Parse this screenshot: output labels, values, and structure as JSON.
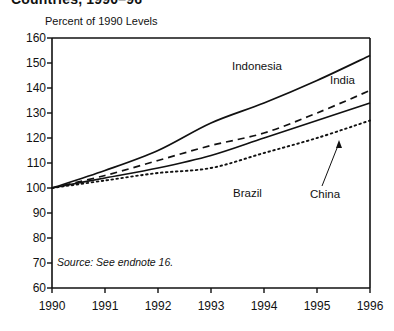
{
  "title": "Countries, 1990–96",
  "axis_note": "Percent of 1990 Levels",
  "source_note": "Source: See endnote 16.",
  "labels": {
    "indonesia": "Indonesia",
    "india": "India",
    "brazil": "Brazil",
    "china": "China"
  },
  "chart_data": {
    "type": "line",
    "title": "Countries, 1990–96",
    "xlabel": "",
    "ylabel": "Percent of 1990 Levels",
    "x": [
      1990,
      1991,
      1992,
      1993,
      1994,
      1995,
      1996
    ],
    "xtick_labels": [
      "1990",
      "1991",
      "1992",
      "1993",
      "1994",
      "1995",
      "1996"
    ],
    "ytick_labels": [
      "60",
      "70",
      "80",
      "90",
      "100",
      "110",
      "120",
      "130",
      "140",
      "150",
      "160"
    ],
    "yticks": [
      60,
      70,
      80,
      90,
      100,
      110,
      120,
      130,
      140,
      150,
      160
    ],
    "xlim": [
      1990,
      1996
    ],
    "ylim": [
      60,
      160
    ],
    "grid": false,
    "legend_position": "inline-annotations",
    "series": [
      {
        "name": "Indonesia",
        "style": "solid",
        "values": [
          100,
          107,
          115,
          126,
          134,
          143,
          153
        ]
      },
      {
        "name": "India",
        "style": "dashed",
        "values": [
          100,
          105,
          111,
          117,
          122,
          130,
          139
        ]
      },
      {
        "name": "Brazil",
        "style": "solid",
        "values": [
          100,
          104,
          108,
          113,
          120,
          127,
          134
        ]
      },
      {
        "name": "China",
        "style": "dotted",
        "values": [
          100,
          103,
          106,
          108,
          114,
          120,
          127
        ]
      }
    ],
    "annotations": [
      {
        "text": "Indonesia",
        "series": "Indonesia"
      },
      {
        "text": "India",
        "series": "India"
      },
      {
        "text": "Brazil",
        "series": "Brazil"
      },
      {
        "text": "China",
        "series": "China",
        "leader_line": true
      }
    ]
  }
}
